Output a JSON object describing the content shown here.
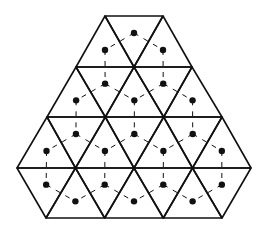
{
  "diagram": {
    "title": "",
    "colors": {
      "background": "#ffffff",
      "lattice_stroke": "#111111",
      "dot_fill": "#111111",
      "dual_stroke": "#111111"
    },
    "lattice": {
      "side": 58.5,
      "row_height": 50.6,
      "rows": [
        {
          "y": 16,
          "x_start": 105,
          "x_end": 163
        },
        {
          "y": 67,
          "x_start": 76,
          "x_end": 192
        },
        {
          "y": 117,
          "x_start": 47,
          "x_end": 222
        },
        {
          "y": 168,
          "x_start": 17,
          "x_end": 251
        },
        {
          "y": 218,
          "x_start": 46,
          "x_end": 222
        }
      ]
    }
  }
}
